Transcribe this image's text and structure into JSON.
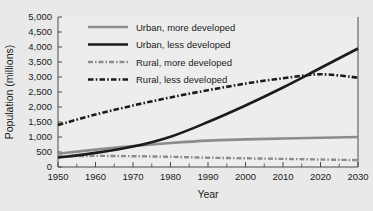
{
  "chart_data": {
    "type": "line",
    "title": "",
    "xlabel": "Year",
    "ylabel": "Population (millions)",
    "xlim": [
      1950,
      2030
    ],
    "ylim": [
      0,
      5000
    ],
    "grid": false,
    "legend_position": "top-center-inside",
    "xticks": [
      1950,
      1960,
      1970,
      1980,
      1990,
      2000,
      2010,
      2020,
      2030
    ],
    "xtick_labels": [
      "1950",
      "1960",
      "1970",
      "1980",
      "1990",
      "2000",
      "2010",
      "2020",
      "2030"
    ],
    "xminor_ticks": [
      1955,
      1965,
      1975,
      1985,
      1995,
      2005,
      2015,
      2025
    ],
    "yticks": [
      0,
      500,
      1000,
      1500,
      2000,
      2500,
      3000,
      3500,
      4000,
      4500,
      5000
    ],
    "ytick_labels": [
      "0",
      "500",
      "1,000",
      "1,500",
      "2,000",
      "2,500",
      "3,000",
      "3,500",
      "4,000",
      "4,500",
      "5,000"
    ],
    "x": [
      1950,
      1960,
      1970,
      1980,
      1990,
      2000,
      2010,
      2020,
      2030
    ],
    "series": [
      {
        "name": "Urban, more developed",
        "color": "#8c8c8c",
        "style": "solid",
        "width": 2.6,
        "values": [
          440,
          580,
          700,
          800,
          880,
          920,
          950,
          975,
          1000
        ]
      },
      {
        "name": "Urban, less developed",
        "color": "#1b1b1b",
        "style": "solid",
        "width": 2.6,
        "values": [
          310,
          470,
          680,
          1010,
          1500,
          2050,
          2650,
          3300,
          3950
        ]
      },
      {
        "name": "Rural, more developed",
        "color": "#8c8c8c",
        "style": "dash-dot",
        "width": 2.4,
        "values": [
          350,
          370,
          360,
          340,
          310,
          290,
          270,
          250,
          230
        ]
      },
      {
        "name": "Rural, less developed",
        "color": "#1b1b1b",
        "style": "dash-dot",
        "width": 2.6,
        "values": [
          1400,
          1750,
          2050,
          2320,
          2560,
          2780,
          2960,
          3090,
          2980
        ]
      }
    ],
    "annotations": [
      "Urban, less developed crosses Rural, less developed near 2018 at about 3,050 million"
    ]
  },
  "legend": {
    "items": [
      {
        "label": "Urban, more developed"
      },
      {
        "label": "Urban, less developed"
      },
      {
        "label": "Rural, more developed"
      },
      {
        "label": "Rural, less developed"
      }
    ]
  }
}
